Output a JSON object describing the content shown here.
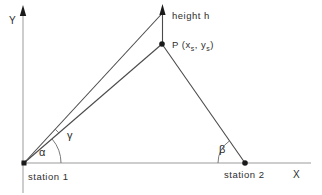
{
  "figure": {
    "name": "triangulation-height-diagram",
    "axes": {
      "y_label": "Y",
      "x_label": "X"
    },
    "labels": {
      "height": "height  h",
      "point_p": {
        "prefix": "P (x",
        "sub1": "s",
        "mid": ", y",
        "sub2": "s",
        "suffix": ")"
      },
      "station1": "station  1",
      "station2": "station  2"
    },
    "angles": {
      "alpha": "α",
      "beta": "β",
      "gamma": "γ"
    },
    "colors": {
      "background": "#ffffff",
      "sight_line": "#4a4a4a",
      "axis_line": "#9b9b9b",
      "arc_line": "#6b6b6b",
      "ink": "#2e2e2e"
    }
  }
}
